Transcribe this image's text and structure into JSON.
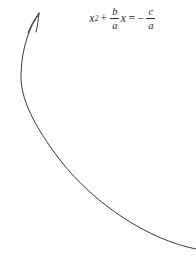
{
  "canvas": {
    "width": 196,
    "height": 279,
    "background_color": "#ffffff",
    "ink_color": "#2b2b2b"
  },
  "equation": {
    "name": "quadratic-normalized-form",
    "plain_text": "x^2 + (b/a)x = -(c/a)",
    "lhs": {
      "term1": {
        "base": "x",
        "exponent": "2"
      },
      "operator": "+",
      "term2": {
        "fraction": {
          "numerator": "b",
          "denominator": "a"
        },
        "variable": "x"
      }
    },
    "relation": "=",
    "rhs": {
      "sign": "−",
      "fraction": {
        "numerator": "c",
        "denominator": "a"
      }
    }
  },
  "annotation": {
    "name": "curved-pointer-arrow",
    "description": "hand-drawn curved arrow sweeping from lower-right up and left, terminating in an arrowhead at upper-left",
    "stroke_color": "#3a3a3a",
    "stroke_width": 1,
    "arrowhead": {
      "tip_x": 40,
      "tip_y": 12,
      "direction": "up-right"
    },
    "path": "M 196 249 C 150 240, 96 206, 60 160 C 34 126, 20 98, 21 74 C 22 46, 30 26, 39 14",
    "barb_left": "M 39 13 C 34 20, 31 25, 28 33",
    "barb_right": "M 39 13 C 38 20, 38 25, 36 32"
  }
}
